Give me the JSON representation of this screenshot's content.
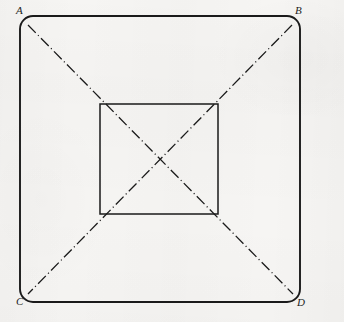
{
  "drawing": {
    "title": "Square frustum / pyramid plan view",
    "medium": "scanned paper technical drawing",
    "background_color": "#f6f5f3",
    "line_color": "#1a1a1a",
    "canvas": {
      "width": 344,
      "height": 322
    },
    "outer_shape": {
      "name": "outer-rounded-square",
      "type": "rounded-rect",
      "x": 20,
      "y": 16,
      "width": 280,
      "height": 286,
      "corner_radius": 13,
      "stroke_width": 1.9,
      "stroke_style": "solid"
    },
    "inner_shape": {
      "name": "inner-square",
      "type": "rect",
      "x": 100,
      "y": 104,
      "width": 118,
      "height": 110,
      "stroke_width": 1.5,
      "stroke_style": "solid"
    },
    "center_point": {
      "x": 159,
      "y": 159
    },
    "diagonals": [
      {
        "name": "diagonal-A-to-D",
        "from_label": "A",
        "to_label": "D",
        "x1": 28,
        "y1": 25,
        "x2": 293,
        "y2": 294,
        "stroke_style": "dash-dot",
        "stroke_width": 1.3
      },
      {
        "name": "diagonal-B-to-C",
        "from_label": "B",
        "to_label": "C",
        "x1": 292,
        "y1": 25,
        "x2": 28,
        "y2": 294,
        "stroke_style": "dash-dot",
        "stroke_width": 1.3
      }
    ],
    "labels": [
      {
        "id": "A",
        "text": "A",
        "corner": "top-left",
        "x": 16,
        "y": 5
      },
      {
        "id": "B",
        "text": "B",
        "corner": "top-right",
        "x": 295,
        "y": 5
      },
      {
        "id": "C",
        "text": "C",
        "corner": "bottom-left",
        "x": 16,
        "y": 296
      },
      {
        "id": "D",
        "text": "D",
        "corner": "bottom-right",
        "x": 297,
        "y": 297
      }
    ]
  }
}
